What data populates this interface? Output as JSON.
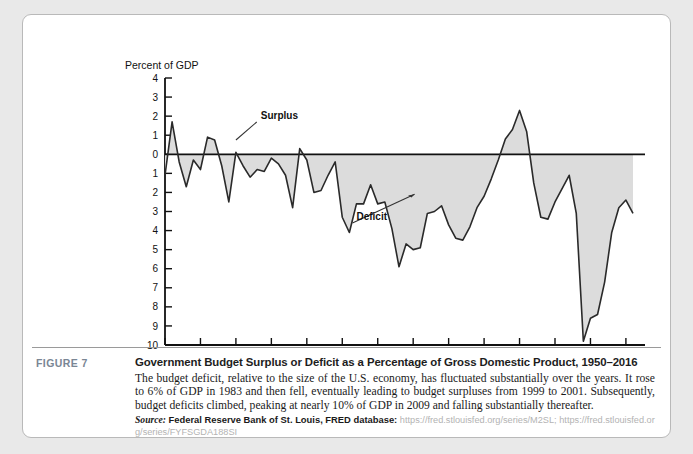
{
  "figure": {
    "label": "FIGURE 7",
    "title": "Government Budget Surplus or Deficit as a Percentage of Gross Domestic Product, 1950–2016",
    "body": "The budget deficit, relative to the size of the U.S. economy, has fluctuated substantially over the years. It rose to 6% of GDP in 1983 and then fell, eventually leading to budget surpluses from 1999 to 2001. Subsequently, budget deficits climbed, peaking at nearly 10% of GDP in 2009 and falling substantially thereafter.",
    "source_word": "Source:",
    "source_publisher": "Federal Reserve Bank of St. Louis, FRED database:",
    "source_url_1": "https://fred.stlouisfed.org/series/M2SL;",
    "source_url_2": "https://fred.stlouisfed.org/series/FYFSGDA188SI"
  },
  "chart_data": {
    "type": "area",
    "title": "",
    "xlabel": "",
    "ylabel": "Percent of GDP",
    "axis_title": "Percent of GDP",
    "xlim": [
      1950,
      2016
    ],
    "ylim": [
      -10,
      4
    ],
    "grid": false,
    "legend_position": "none",
    "y_tick_labels": [
      "4",
      "3",
      "2",
      "1",
      "0",
      "1",
      "2",
      "3",
      "4",
      "5",
      "6",
      "7",
      "8",
      "9",
      "10"
    ],
    "y_tick_values": [
      4,
      3,
      2,
      1,
      0,
      -1,
      -2,
      -3,
      -4,
      -5,
      -6,
      -7,
      -8,
      -9,
      -10
    ],
    "x_tick_labels": [
      "1950",
      "1955",
      "1960",
      "1965",
      "1970",
      "1975",
      "1980",
      "1985",
      "1990",
      "1995",
      "2000",
      "2005",
      "2010",
      "2015"
    ],
    "x_tick_values": [
      1950,
      1955,
      1960,
      1965,
      1970,
      1975,
      1980,
      1985,
      1990,
      1995,
      2000,
      2005,
      2010,
      2015
    ],
    "annotations": [
      {
        "text": "Surplus",
        "x": 1963.5,
        "y": 1.85,
        "points_to_x": 1960.0,
        "points_to_y": 0.75
      },
      {
        "text": "Deficit",
        "x": 1977.0,
        "y": -3.45,
        "points_to_x": 1985.2,
        "points_to_y": -2.1
      }
    ],
    "series": [
      {
        "name": "Federal Surplus or Deficit as Percent of GDP",
        "fill_color": "#dcdcdc",
        "line_color": "#2a2a2a",
        "x": [
          1950,
          1951,
          1952,
          1953,
          1954,
          1955,
          1956,
          1957,
          1958,
          1959,
          1960,
          1961,
          1962,
          1963,
          1964,
          1965,
          1966,
          1967,
          1968,
          1969,
          1970,
          1971,
          1972,
          1973,
          1974,
          1975,
          1976,
          1977,
          1978,
          1979,
          1980,
          1981,
          1982,
          1983,
          1984,
          1985,
          1986,
          1987,
          1988,
          1989,
          1990,
          1991,
          1992,
          1993,
          1994,
          1995,
          1996,
          1997,
          1998,
          1999,
          2000,
          2001,
          2002,
          2003,
          2004,
          2005,
          2006,
          2007,
          2008,
          2009,
          2010,
          2011,
          2012,
          2013,
          2014,
          2015,
          2016
        ],
        "values": [
          -1.1,
          1.7,
          -0.4,
          -1.7,
          -0.3,
          -0.8,
          0.9,
          0.75,
          -0.6,
          -2.5,
          0.1,
          -0.6,
          -1.2,
          -0.8,
          -0.9,
          -0.2,
          -0.5,
          -1.1,
          -2.8,
          0.3,
          -0.3,
          -2.0,
          -1.9,
          -1.1,
          -0.4,
          -3.3,
          -4.1,
          -2.6,
          -2.6,
          -1.6,
          -2.6,
          -2.5,
          -3.9,
          -5.9,
          -4.7,
          -5.0,
          -4.9,
          -3.1,
          -3.0,
          -2.7,
          -3.7,
          -4.4,
          -4.5,
          -3.8,
          -2.8,
          -2.2,
          -1.3,
          -0.3,
          0.8,
          1.3,
          2.3,
          1.2,
          -1.5,
          -3.3,
          -3.4,
          -2.5,
          -1.8,
          -1.1,
          -3.1,
          -9.8,
          -8.6,
          -8.4,
          -6.7,
          -4.1,
          -2.8,
          -2.4,
          -3.1
        ]
      }
    ]
  }
}
